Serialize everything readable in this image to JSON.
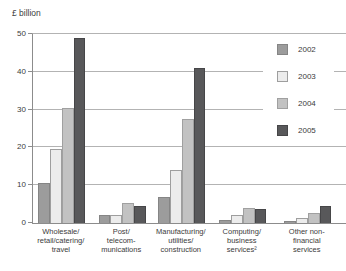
{
  "unit_label": "£ billion",
  "colors": {
    "grid": "#b3b3b3",
    "axis": "#8c8c8c",
    "text": "#3b3b3b",
    "series_2002": "#9c9c9c",
    "series_2003": "#ececec",
    "series_2004": "#c2c2c2",
    "series_2005": "#58585a"
  },
  "chart_data": {
    "type": "bar",
    "title": "",
    "ylabel": "£ billion",
    "xlabel": "",
    "ylim": [
      0,
      50
    ],
    "yticks": [
      0,
      10,
      20,
      30,
      40,
      50
    ],
    "grid": true,
    "legend_position": "right",
    "categories": [
      "Wholesale/\nretail/catering/\ntravel",
      "Post/\ntelecom-\nmunications",
      "Manufacturing/\nutilities/\nconstruction",
      "Computing/\nbusiness\nservices²",
      "Other non-\nfinancial\nservices"
    ],
    "series": [
      {
        "name": "2002",
        "color": "#9c9c9c",
        "border": "#858585",
        "values": [
          10.5,
          2.0,
          7.0,
          0.8,
          0.6
        ]
      },
      {
        "name": "2003",
        "color": "#ececec",
        "border": "#9e9e9e",
        "values": [
          19.5,
          2.2,
          14.0,
          2.1,
          1.4
        ]
      },
      {
        "name": "2004",
        "color": "#c2c2c2",
        "border": "#a0a0a0",
        "values": [
          30.5,
          5.3,
          27.5,
          4.0,
          2.6
        ]
      },
      {
        "name": "2005",
        "color": "#58585a",
        "border": "#464648",
        "values": [
          49.0,
          4.5,
          41.0,
          3.7,
          4.6
        ]
      }
    ]
  }
}
